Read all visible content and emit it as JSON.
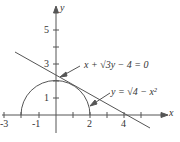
{
  "axes": {
    "x_label": "x",
    "y_label": "y"
  },
  "x_ticks": [
    "-3",
    "-1",
    "2",
    "4"
  ],
  "y_ticks": [
    "5",
    "3",
    "1"
  ],
  "line": {
    "equation": "x + √3y − 4 = 0"
  },
  "curve": {
    "equation": "y = √4 − x²"
  },
  "colors": {
    "stroke": "#555555"
  }
}
